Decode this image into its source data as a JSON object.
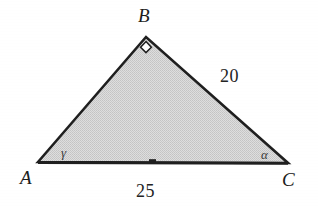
{
  "figure": {
    "kind": "geometry-diagram",
    "shape": "triangle",
    "background_color": "#ffffff",
    "fill_color": "#d4d4d4",
    "stroke_color": "#1f1f1f",
    "vertices": [
      {
        "name": "A",
        "label": "A",
        "x": 38,
        "y": 162
      },
      {
        "name": "B",
        "label": "B",
        "x": 146,
        "y": 37
      },
      {
        "name": "C",
        "label": "C",
        "x": 288,
        "y": 163
      }
    ],
    "angles": [
      {
        "at": "A",
        "label": "γ",
        "kind": "named"
      },
      {
        "at": "B",
        "label": "",
        "kind": "right-angle"
      },
      {
        "at": "C",
        "label": "α",
        "kind": "named"
      }
    ],
    "sides": [
      {
        "from": "B",
        "to": "C",
        "label": "20"
      },
      {
        "from": "A",
        "to": "C",
        "label": "25"
      }
    ],
    "tick_mark": {
      "on_side": "AC",
      "at_midpoint": true
    }
  }
}
